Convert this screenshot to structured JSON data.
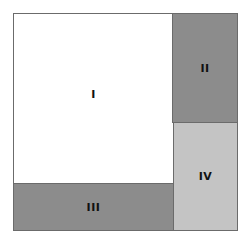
{
  "diagram": {
    "type": "partition-square",
    "regions": [
      {
        "id": "I",
        "label": "I",
        "color": "#ffffff"
      },
      {
        "id": "II",
        "label": "II",
        "color": "#8c8c8c"
      },
      {
        "id": "III",
        "label": "III",
        "color": "#8c8c8c"
      },
      {
        "id": "IV",
        "label": "IV",
        "color": "#c4c4c4"
      }
    ],
    "border_color": "#6b6b6b"
  }
}
